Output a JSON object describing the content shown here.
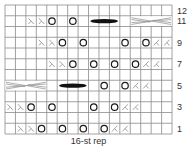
{
  "chart": {
    "grid": {
      "cols": 16,
      "rows": 12,
      "left": 5,
      "top": 5,
      "cell_w": 10.44,
      "cell_h": 10.75,
      "line_color": "#8a8a8a",
      "yo_color": "#1a1a1a",
      "dec_color": "#999999",
      "bobble_color": "#111111",
      "cable_color": "#999999"
    },
    "row_labels": [
      {
        "row": 12,
        "label": "12"
      },
      {
        "row": 11,
        "label": "11"
      },
      {
        "row": 9,
        "label": "9"
      },
      {
        "row": 7,
        "label": "7"
      },
      {
        "row": 5,
        "label": "5"
      },
      {
        "row": 3,
        "label": "3"
      },
      {
        "row": 1,
        "label": "1"
      }
    ],
    "footer": "16-st rep",
    "legend_symbols": {
      "yo": "yarn over (O)",
      "ssk": "ssk (λ)",
      "k2tog": "k2tog (⋌)",
      "bobble": "bobble bar",
      "cable": "cable cross"
    },
    "rows": [
      {
        "row": 11,
        "cells": [
          {
            "col": 3,
            "sym": "ssk"
          },
          {
            "col": 4,
            "sym": "ssk"
          },
          {
            "col": 5,
            "sym": "yo"
          },
          {
            "col": 7,
            "sym": "yo"
          },
          {
            "col": 9,
            "sym": "bobble",
            "span": 3
          },
          {
            "col": 13,
            "sym": "cable",
            "span": 4
          }
        ]
      },
      {
        "row": 9,
        "cells": [
          {
            "col": 4,
            "sym": "ssk"
          },
          {
            "col": 5,
            "sym": "ssk"
          },
          {
            "col": 6,
            "sym": "yo"
          },
          {
            "col": 8,
            "sym": "yo"
          },
          {
            "col": 12,
            "sym": "yo"
          },
          {
            "col": 14,
            "sym": "yo"
          },
          {
            "col": 15,
            "sym": "k2tog"
          },
          {
            "col": 16,
            "sym": "k2tog"
          }
        ]
      },
      {
        "row": 7,
        "cells": [
          {
            "col": 5,
            "sym": "ssk"
          },
          {
            "col": 6,
            "sym": "ssk"
          },
          {
            "col": 7,
            "sym": "yo"
          },
          {
            "col": 9,
            "sym": "yo"
          },
          {
            "col": 11,
            "sym": "yo"
          },
          {
            "col": 13,
            "sym": "yo"
          },
          {
            "col": 14,
            "sym": "k2tog"
          },
          {
            "col": 15,
            "sym": "k2tog"
          }
        ]
      },
      {
        "row": 5,
        "cells": [
          {
            "col": 1,
            "sym": "cable",
            "span": 4
          },
          {
            "col": 6,
            "sym": "bobble",
            "span": 3
          },
          {
            "col": 10,
            "sym": "yo"
          },
          {
            "col": 12,
            "sym": "yo"
          },
          {
            "col": 13,
            "sym": "k2tog"
          },
          {
            "col": 14,
            "sym": "k2tog"
          }
        ]
      },
      {
        "row": 3,
        "cells": [
          {
            "col": 1,
            "sym": "ssk"
          },
          {
            "col": 2,
            "sym": "ssk"
          },
          {
            "col": 3,
            "sym": "yo"
          },
          {
            "col": 5,
            "sym": "yo"
          },
          {
            "col": 9,
            "sym": "yo"
          },
          {
            "col": 11,
            "sym": "yo"
          },
          {
            "col": 12,
            "sym": "k2tog"
          },
          {
            "col": 13,
            "sym": "k2tog"
          }
        ]
      },
      {
        "row": 1,
        "cells": [
          {
            "col": 2,
            "sym": "ssk"
          },
          {
            "col": 3,
            "sym": "ssk"
          },
          {
            "col": 4,
            "sym": "yo"
          },
          {
            "col": 6,
            "sym": "yo"
          },
          {
            "col": 8,
            "sym": "yo"
          },
          {
            "col": 10,
            "sym": "yo"
          },
          {
            "col": 11,
            "sym": "k2tog"
          },
          {
            "col": 12,
            "sym": "k2tog"
          }
        ]
      }
    ]
  }
}
